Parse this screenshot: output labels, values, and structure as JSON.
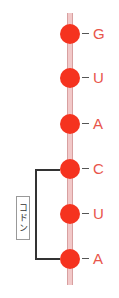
{
  "strand": {
    "name": "mRNA strand",
    "bases": [
      {
        "letter": "G",
        "top": 24
      },
      {
        "letter": "U",
        "top": 68
      },
      {
        "letter": "A",
        "top": 114
      },
      {
        "letter": "C",
        "top": 159
      },
      {
        "letter": "U",
        "top": 204
      },
      {
        "letter": "A",
        "top": 249
      }
    ]
  },
  "codon": {
    "label": "コドン",
    "spans_bases": [
      "C",
      "U",
      "A"
    ]
  },
  "colors": {
    "base_dot": "#f5331f",
    "letter": "#e8554a",
    "strand": "#f2c9c9"
  }
}
